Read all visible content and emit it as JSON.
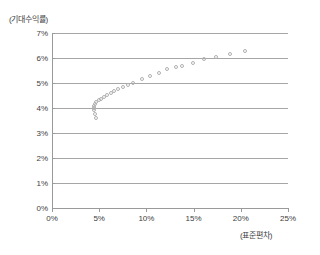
{
  "chart_data": {
    "type": "scatter",
    "title": "",
    "subtitle": "",
    "xlabel": "(표준편차)",
    "ylabel": "(기대수익률)",
    "xlim": [
      0,
      25
    ],
    "ylim": [
      0,
      7
    ],
    "x_tick_labels": [
      "0%",
      "5%",
      "10%",
      "15%",
      "20%",
      "25%"
    ],
    "x_ticks": [
      0,
      5,
      10,
      15,
      20,
      25
    ],
    "y_tick_labels": [
      "0%",
      "1%",
      "2%",
      "3%",
      "4%",
      "5%",
      "6%",
      "7%"
    ],
    "y_ticks": [
      0,
      1,
      2,
      3,
      4,
      5,
      6,
      7
    ],
    "grid": "horizontal",
    "legend": "none",
    "series": [
      {
        "name": "efficient-frontier",
        "marker": "open-circle",
        "color": "#b0b0b0",
        "points": [
          [
            4.7,
            3.62
          ],
          [
            4.55,
            3.78
          ],
          [
            4.45,
            3.92
          ],
          [
            4.42,
            4.02
          ],
          [
            4.45,
            4.1
          ],
          [
            4.55,
            4.18
          ],
          [
            4.7,
            4.25
          ],
          [
            4.95,
            4.32
          ],
          [
            5.2,
            4.38
          ],
          [
            5.5,
            4.45
          ],
          [
            5.85,
            4.52
          ],
          [
            6.2,
            4.6
          ],
          [
            6.6,
            4.68
          ],
          [
            7.0,
            4.76
          ],
          [
            7.5,
            4.83
          ],
          [
            8.0,
            4.91
          ],
          [
            8.6,
            4.99
          ],
          [
            9.55,
            5.15
          ],
          [
            10.4,
            5.28
          ],
          [
            11.3,
            5.42
          ],
          [
            12.2,
            5.55
          ],
          [
            13.1,
            5.65
          ],
          [
            13.8,
            5.68
          ],
          [
            14.9,
            5.79
          ],
          [
            16.1,
            5.95
          ],
          [
            17.4,
            6.05
          ],
          [
            18.9,
            6.16
          ],
          [
            20.4,
            6.27
          ]
        ]
      }
    ],
    "colors": {
      "axis": "#9a9a9a",
      "gridline": "#a6a6a6",
      "marker": "#b0b0b0",
      "text": "#404040",
      "background": "#ffffff"
    }
  }
}
